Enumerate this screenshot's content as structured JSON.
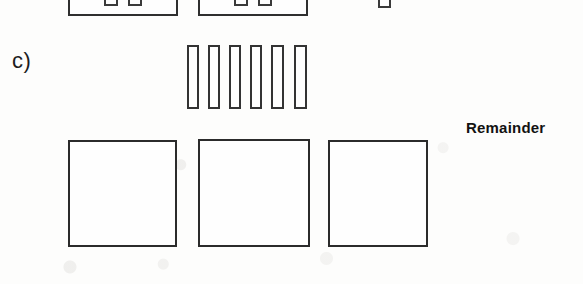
{
  "figure": {
    "panel_label": "c)",
    "annotation_label": "Remainder",
    "line_color": "#2f2f2f",
    "fill_color": "#fefefe",
    "background_color": "#fdfdfc",
    "text_color": "#121212"
  },
  "top_row": {
    "name": "clipped-module-row",
    "modules": [
      {
        "label": "module-left",
        "x": 68,
        "y": -16,
        "width": 110,
        "height": 32,
        "pins": [
          {
            "label": "pin-1",
            "x": 104,
            "y": -12,
            "width": 14,
            "height": 18
          },
          {
            "label": "pin-2",
            "x": 128,
            "y": -12,
            "width": 14,
            "height": 18
          }
        ]
      },
      {
        "label": "module-right",
        "x": 198,
        "y": -16,
        "width": 110,
        "height": 32,
        "pins": [
          {
            "label": "pin-1",
            "x": 234,
            "y": -12,
            "width": 14,
            "height": 18
          },
          {
            "label": "pin-2",
            "x": 258,
            "y": -12,
            "width": 14,
            "height": 18
          }
        ]
      }
    ],
    "stray_pin": {
      "label": "stray-pin",
      "x": 378,
      "y": -12,
      "width": 13,
      "height": 20
    }
  },
  "fin_row": {
    "name": "vertical-fin-row",
    "count": 6,
    "fins": [
      {
        "label": "fin-1",
        "x": 187,
        "y": 45,
        "width": 12,
        "height": 64
      },
      {
        "label": "fin-2",
        "x": 208,
        "y": 45,
        "width": 12,
        "height": 64
      },
      {
        "label": "fin-3",
        "x": 229,
        "y": 45,
        "width": 12,
        "height": 64
      },
      {
        "label": "fin-4",
        "x": 250,
        "y": 45,
        "width": 12,
        "height": 64
      },
      {
        "label": "fin-5",
        "x": 271,
        "y": 45,
        "width": 13,
        "height": 64
      },
      {
        "label": "fin-6",
        "x": 294,
        "y": 45,
        "width": 13,
        "height": 64
      }
    ]
  },
  "tile_row": {
    "name": "large-tile-row",
    "count": 3,
    "tiles": [
      {
        "label": "tile-1",
        "x": 68,
        "y": 140,
        "width": 109,
        "height": 107
      },
      {
        "label": "tile-2",
        "x": 198,
        "y": 139,
        "width": 112,
        "height": 108
      },
      {
        "label": "tile-3",
        "x": 328,
        "y": 140,
        "width": 100,
        "height": 107
      }
    ]
  },
  "labels": {
    "panel": {
      "text": "c)",
      "x": 12,
      "y": 50
    },
    "remainder": {
      "text": "Remainder",
      "x": 466,
      "y": 120
    }
  }
}
